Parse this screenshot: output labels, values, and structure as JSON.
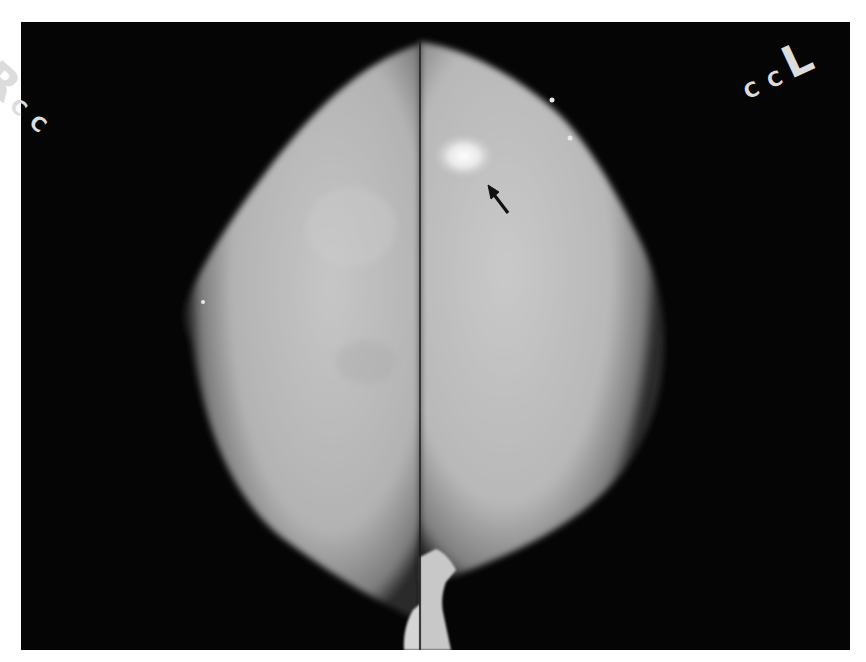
{
  "image": {
    "type": "mammogram",
    "views": [
      {
        "side": "R",
        "view": "CC",
        "position": "left-half"
      },
      {
        "side": "L",
        "view": "CC",
        "position": "right-half"
      }
    ],
    "background_color": "#050505",
    "page_color": "#ffffff",
    "tissue_color": "#bdbdbd"
  },
  "markers": {
    "left": {
      "side": "R",
      "view": "C C"
    },
    "right": {
      "side": "L",
      "view": "C C"
    }
  },
  "annotation": {
    "type": "arrow",
    "color": "#111111",
    "target": "bright focal density in upper-outer region of left breast"
  }
}
